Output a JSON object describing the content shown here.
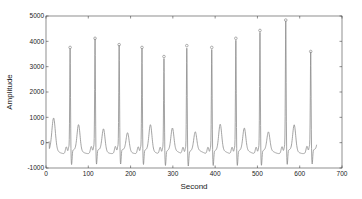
{
  "chart_data": {
    "type": "line",
    "title": "",
    "xlabel": "Second",
    "ylabel": "Amplitude",
    "xlim": [
      0,
      700
    ],
    "ylim": [
      -1000,
      5000
    ],
    "xticks": [
      0,
      100,
      200,
      300,
      400,
      500,
      600,
      700
    ],
    "yticks": [
      -1000,
      0,
      1000,
      2000,
      3000,
      4000,
      5000
    ],
    "grid": false,
    "legend": null,
    "line_color": "#8c8c8c",
    "marker_color": "#8c8c8c",
    "series": [
      {
        "name": "signal",
        "description": "ECG-like signal with sharp R-peaks marked by small circles; baseline near -300 to 0 with P and T waves",
        "r_peaks": {
          "x": [
            57,
            116,
            173,
            227,
            279,
            333,
            392,
            449,
            506,
            567,
            626
          ],
          "y": [
            3760,
            4120,
            3870,
            3760,
            3400,
            3830,
            3760,
            4120,
            4430,
            4840,
            3600
          ]
        },
        "signal_x_range": [
          0,
          640
        ]
      }
    ]
  }
}
